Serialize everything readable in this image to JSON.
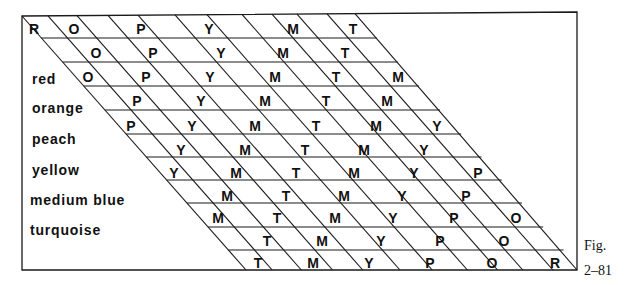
{
  "figure": {
    "caption_line1": "Fig.",
    "caption_line2": "2–81",
    "stroke_color": "#1a1a1a",
    "text_color": "#111111"
  },
  "row_labels": [
    {
      "label": "red",
      "x": 32,
      "y": 84
    },
    {
      "label": "orange",
      "x": 32,
      "y": 113
    },
    {
      "label": "peach",
      "x": 32,
      "y": 144
    },
    {
      "label": "yellow",
      "x": 32,
      "y": 175
    },
    {
      "label": "medium blue",
      "x": 30,
      "y": 205
    },
    {
      "label": "turquoise",
      "x": 30,
      "y": 235
    }
  ],
  "rows": [
    {
      "y": 34,
      "cells": [
        {
          "t": "R",
          "x": 34
        },
        {
          "t": "O",
          "x": 74
        },
        {
          "t": "P",
          "x": 141
        },
        {
          "t": "Y",
          "x": 209
        },
        {
          "t": "M",
          "x": 293
        },
        {
          "t": "T",
          "x": 353
        }
      ]
    },
    {
      "y": 58,
      "cells": [
        {
          "t": "O",
          "x": 96
        },
        {
          "t": "P",
          "x": 153
        },
        {
          "t": "Y",
          "x": 221
        },
        {
          "t": "M",
          "x": 283
        },
        {
          "t": "T",
          "x": 345
        }
      ]
    },
    {
      "y": 82,
      "cells": [
        {
          "t": "O",
          "x": 88
        },
        {
          "t": "P",
          "x": 146
        },
        {
          "t": "Y",
          "x": 210
        },
        {
          "t": "M",
          "x": 275
        },
        {
          "t": "T",
          "x": 336
        },
        {
          "t": "M",
          "x": 398
        }
      ]
    },
    {
      "y": 106,
      "cells": [
        {
          "t": "P",
          "x": 137
        },
        {
          "t": "Y",
          "x": 201
        },
        {
          "t": "M",
          "x": 265
        },
        {
          "t": "T",
          "x": 326
        },
        {
          "t": "M",
          "x": 387
        }
      ]
    },
    {
      "y": 131,
      "cells": [
        {
          "t": "P",
          "x": 131
        },
        {
          "t": "Y",
          "x": 192
        },
        {
          "t": "M",
          "x": 255
        },
        {
          "t": "T",
          "x": 316
        },
        {
          "t": "M",
          "x": 376
        },
        {
          "t": "Y",
          "x": 437
        }
      ]
    },
    {
      "y": 155,
      "cells": [
        {
          "t": "Y",
          "x": 181
        },
        {
          "t": "M",
          "x": 245
        },
        {
          "t": "T",
          "x": 305
        },
        {
          "t": "M",
          "x": 364
        },
        {
          "t": "Y",
          "x": 424
        }
      ]
    },
    {
      "y": 178,
      "cells": [
        {
          "t": "Y",
          "x": 174
        },
        {
          "t": "M",
          "x": 236
        },
        {
          "t": "T",
          "x": 296
        },
        {
          "t": "M",
          "x": 354
        },
        {
          "t": "Y",
          "x": 414
        },
        {
          "t": "P",
          "x": 478
        }
      ]
    },
    {
      "y": 201,
      "cells": [
        {
          "t": "M",
          "x": 227
        },
        {
          "t": "T",
          "x": 286
        },
        {
          "t": "M",
          "x": 344
        },
        {
          "t": "Y",
          "x": 402
        },
        {
          "t": "P",
          "x": 466
        }
      ]
    },
    {
      "y": 223,
      "cells": [
        {
          "t": "M",
          "x": 218
        },
        {
          "t": "T",
          "x": 277
        },
        {
          "t": "M",
          "x": 335
        },
        {
          "t": "Y",
          "x": 393
        },
        {
          "t": "P",
          "x": 454
        },
        {
          "t": "O",
          "x": 516
        }
      ]
    },
    {
      "y": 246,
      "cells": [
        {
          "t": "T",
          "x": 267
        },
        {
          "t": "M",
          "x": 322
        },
        {
          "t": "Y",
          "x": 381
        },
        {
          "t": "P",
          "x": 440
        },
        {
          "t": "O",
          "x": 504
        }
      ]
    },
    {
      "y": 268,
      "cells": [
        {
          "t": "T",
          "x": 258
        },
        {
          "t": "M",
          "x": 313
        },
        {
          "t": "Y",
          "x": 369
        },
        {
          "t": "P",
          "x": 430
        },
        {
          "t": "O",
          "x": 492
        },
        {
          "t": "R",
          "x": 555
        }
      ]
    }
  ],
  "grid": {
    "frame": {
      "left": 22,
      "top_left_y": 16,
      "top_right_x": 577,
      "top_right_y": 12,
      "bottom_y": 270,
      "right": 577
    },
    "diagonal_top_x": [
      22,
      48,
      77,
      108,
      138,
      175,
      207,
      242,
      272,
      297,
      327,
      355
    ],
    "diagonal_dx": 224,
    "h_lines_y": [
      38,
      62,
      86,
      110,
      134,
      157,
      180,
      203,
      227,
      250
    ]
  }
}
